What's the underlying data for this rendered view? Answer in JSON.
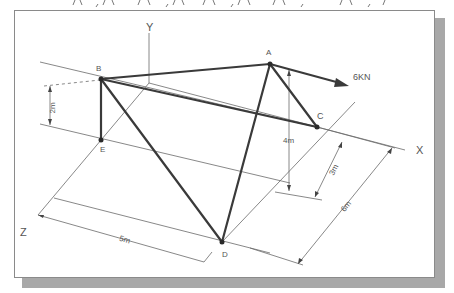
{
  "diagram": {
    "points": {
      "A": {
        "label": "A",
        "x": 270,
        "y": 64
      },
      "B": {
        "label": "B",
        "x": 101,
        "y": 79
      },
      "C": {
        "label": "C",
        "x": 317,
        "y": 127
      },
      "D": {
        "label": "D",
        "x": 222,
        "y": 242
      },
      "E": {
        "label": "E",
        "x": 101,
        "y": 140
      }
    },
    "axes": {
      "x_label": "X",
      "y_label": "Y",
      "z_label": "Z"
    },
    "dimensions": {
      "height_B": "2m",
      "height_A": "4m",
      "dist_C": "3m",
      "dist_total": "6m",
      "dist_D": "5m"
    },
    "force": {
      "label": "6KN",
      "magnitude": 6,
      "unit": "KN"
    },
    "colors": {
      "member": "#3a3a3a",
      "construction": "#6a6a6a",
      "shadow": "#a8a8a8"
    }
  }
}
